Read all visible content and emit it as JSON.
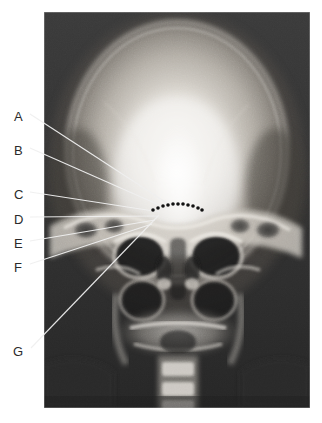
{
  "figure": {
    "kind": "annotated-radiograph",
    "modality": "plain-film-radiograph",
    "view": "PA skull (posteroanterior / occipitofrontal projection)",
    "background_color": "#ffffff",
    "plate": {
      "x": 44,
      "y": 12,
      "width": 266,
      "height": 396,
      "border_color": "#d8d8d8",
      "film_dark": "#2b2b2b",
      "bone_bright": "#f2f0ec"
    }
  },
  "labels": [
    {
      "id": "A",
      "text": "A",
      "x": 14,
      "y": 110,
      "leader": {
        "x1": 30,
        "y1": 114,
        "x2": 170,
        "y2": 205
      },
      "style": "light"
    },
    {
      "id": "B",
      "text": "B",
      "x": 14,
      "y": 144,
      "leader": {
        "x1": 30,
        "y1": 148,
        "x2": 166,
        "y2": 208
      },
      "style": "light"
    },
    {
      "id": "C",
      "text": "C",
      "x": 14,
      "y": 188,
      "leader": {
        "x1": 30,
        "y1": 192,
        "x2": 160,
        "y2": 212
      },
      "style": "light"
    },
    {
      "id": "D",
      "text": "D",
      "x": 14,
      "y": 213,
      "leader": {
        "x1": 30,
        "y1": 217,
        "x2": 157,
        "y2": 216
      },
      "style": "light"
    },
    {
      "id": "E",
      "text": "E",
      "x": 14,
      "y": 237,
      "leader": {
        "x1": 30,
        "y1": 241,
        "x2": 155,
        "y2": 220
      },
      "style": "light"
    },
    {
      "id": "F",
      "text": "F",
      "x": 14,
      "y": 261,
      "leader": {
        "x1": 30,
        "y1": 264,
        "x2": 152,
        "y2": 224
      },
      "style": "light"
    },
    {
      "id": "G",
      "text": "G",
      "x": 13,
      "y": 345,
      "leader": {
        "x1": 31,
        "y1": 348,
        "x2": 159,
        "y2": 215
      },
      "style": "light"
    }
  ],
  "dotted_marker": {
    "name": "dotted-arc-marker",
    "color": "#121212",
    "dot_radius": 1.8,
    "points": [
      [
        153,
        210
      ],
      [
        158,
        208
      ],
      [
        163,
        206
      ],
      [
        168,
        205
      ],
      [
        173,
        204
      ],
      [
        178,
        204
      ],
      [
        183,
        204
      ],
      [
        188,
        205
      ],
      [
        193,
        206
      ],
      [
        198,
        208
      ],
      [
        202,
        210
      ]
    ]
  },
  "anatomy": {
    "cranial_vault": "calvarium",
    "orbits": "bilateral orbital rims",
    "sinuses": "frontal, ethmoid and maxillary sinuses",
    "nasal": "nasal septum and turbinates",
    "petrous": "petrous ridges of temporal bones"
  }
}
